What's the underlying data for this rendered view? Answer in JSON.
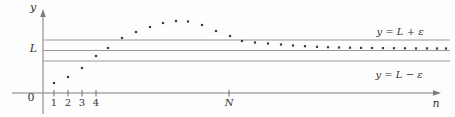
{
  "figure": {
    "width": 455,
    "height": 117,
    "bg": "#fdfdfd",
    "colors": {
      "guide": "#9a9a9a",
      "axis": "#7d7d7d",
      "tick": "#5f5f5f",
      "dot": "#3c3c3c",
      "text": "#333333"
    },
    "y_axis": {
      "x": 43,
      "top": 9,
      "bottom": 114,
      "label": "y",
      "label_x": 33,
      "label_y": 11
    },
    "x_axis": {
      "y": 93,
      "left": 12,
      "right": 441,
      "label": "n",
      "label_x": 436,
      "label_y": 107
    },
    "origin": {
      "label": "0",
      "x": 31,
      "y": 101
    },
    "guides": {
      "x1": 43,
      "x2": 450,
      "upper": {
        "y": 40,
        "label": "y = L + ε",
        "label_x": 400,
        "label_y": 35
      },
      "center": {
        "y": 50.5,
        "label": "L",
        "label_x": 37,
        "label_y": 52
      },
      "lower": {
        "y": 61,
        "label": "y = L − ε",
        "label_x": 399,
        "label_y": 78
      }
    },
    "ticks": [
      {
        "label": "1",
        "x": 54,
        "italic": false
      },
      {
        "label": "2",
        "x": 68,
        "italic": false
      },
      {
        "label": "3",
        "x": 82,
        "italic": false
      },
      {
        "label": "4",
        "x": 96,
        "italic": false
      },
      {
        "label": "N",
        "x": 229,
        "italic": true
      }
    ],
    "tick_label_y": 106,
    "tick_top": 90,
    "tick_bottom": 96.5,
    "points_px": [
      [
        54,
        83
      ],
      [
        68,
        77
      ],
      [
        82,
        68
      ],
      [
        96,
        56
      ],
      [
        108,
        48
      ],
      [
        122,
        38
      ],
      [
        136,
        32
      ],
      [
        150,
        27
      ],
      [
        163,
        23
      ],
      [
        176,
        21
      ],
      [
        188,
        21.5
      ],
      [
        202,
        25
      ],
      [
        216,
        31
      ],
      [
        230,
        36
      ],
      [
        242,
        41
      ],
      [
        255,
        42.5
      ],
      [
        268,
        43.5
      ],
      [
        281,
        44.5
      ],
      [
        293,
        45.5
      ],
      [
        305,
        46.2
      ],
      [
        317,
        46.8
      ],
      [
        328,
        47.2
      ],
      [
        339,
        47.5
      ],
      [
        350,
        47.7
      ],
      [
        361,
        47.9
      ],
      [
        372,
        48
      ],
      [
        383,
        48.1
      ],
      [
        394,
        48.2
      ],
      [
        405,
        48.3
      ],
      [
        416,
        48.4
      ],
      [
        427,
        48.4
      ],
      [
        437,
        48.5
      ],
      [
        446,
        48.5
      ]
    ]
  },
  "chart_data": {
    "type": "scatter",
    "title": "",
    "xlabel": "n",
    "ylabel": "y",
    "x": [
      1,
      2,
      3,
      4,
      5,
      6,
      7,
      8,
      9,
      10,
      11,
      12,
      13,
      14,
      15,
      16,
      17,
      18,
      19,
      20,
      21,
      22,
      23,
      24,
      25,
      26,
      27,
      28,
      29,
      30,
      31,
      32,
      33
    ],
    "y_offset_from_L_in_eps_units": [
      -3.1,
      -2.52,
      -1.67,
      -0.52,
      0.24,
      1.19,
      1.76,
      2.24,
      2.62,
      2.81,
      2.76,
      2.43,
      1.86,
      1.38,
      0.9,
      0.76,
      0.67,
      0.57,
      0.48,
      0.41,
      0.35,
      0.31,
      0.29,
      0.27,
      0.25,
      0.24,
      0.23,
      0.22,
      0.21,
      0.2,
      0.2,
      0.19,
      0.19
    ],
    "reference_lines": [
      {
        "value": "L + ε",
        "label": "y = L + ε"
      },
      {
        "value": "L",
        "label": "L"
      },
      {
        "value": "L − ε",
        "label": "y = L − ε"
      }
    ],
    "x_tick_labels": [
      "1",
      "2",
      "3",
      "4",
      "N"
    ],
    "origin_label": "0",
    "axis_labels": {
      "x": "n",
      "y": "y"
    },
    "legend": false,
    "grid": false,
    "description_of_content": "Dots for a sequence a_n that starts below L−ε, rises above L+ε, peaks, then converges to L from above; for n ≥ N the points lie inside the ε-band around L."
  }
}
